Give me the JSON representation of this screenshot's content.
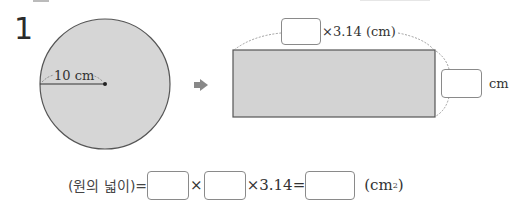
{
  "problem": {
    "number": "1",
    "circle": {
      "radius_label": "10 cm",
      "fill_color": "#d6d6d6",
      "center_dot": "center-point"
    },
    "arrow_icon": "right-arrow",
    "rectangle": {
      "fill_color": "#d3d3d3",
      "width_suffix": "×3.14 (cm)",
      "height_suffix": "cm",
      "width_blank": "",
      "height_blank": ""
    },
    "formula": {
      "label": "(원의 넓이)=",
      "times1": "×",
      "times2": "×3.14=",
      "unit_open": "(cm",
      "unit_sup": "2",
      "unit_close": ")",
      "blank1": "",
      "blank2": "",
      "blank3": ""
    }
  }
}
